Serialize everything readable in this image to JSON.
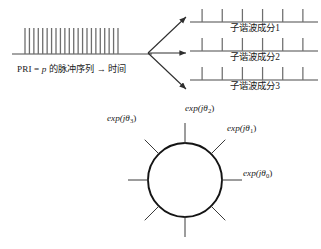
{
  "figure": {
    "background": "#ffffff",
    "line_color": "#3a3a3a",
    "pulse_color": "#6e6e6e",
    "circle_color": "#141414"
  },
  "pulse_train": {
    "caption_prefix": "PRI = ",
    "caption_var": "p",
    "caption_suffix": " 的脉冲序列 → 时间",
    "caption_full": "PRI = p 的脉冲序列 → 时间",
    "pulse_count": 22,
    "baseline_y": 54,
    "x_start": 25,
    "x_end": 118,
    "pulse_height": 26
  },
  "arrows": {
    "origin_x": 148,
    "origin_y": 53,
    "count": 3,
    "targets": [
      {
        "x": 186,
        "y": 17
      },
      {
        "x": 186,
        "y": 53
      },
      {
        "x": 186,
        "y": 89
      }
    ]
  },
  "subharmonic_panels": [
    {
      "label": "子谐波成分1",
      "baseline_y": 22,
      "x_start": 190,
      "x_end": 318,
      "tick_count": 6,
      "tick_height": 13
    },
    {
      "label": "子谐波成分2",
      "baseline_y": 51,
      "x_start": 190,
      "x_end": 318,
      "tick_count": 6,
      "tick_height": 13
    },
    {
      "label": "子谐波成分3",
      "baseline_y": 80,
      "x_start": 190,
      "x_end": 318,
      "tick_count": 6,
      "tick_height": 13
    }
  ],
  "phasor_circle": {
    "center_x": 185,
    "center_y": 180,
    "radius": 37,
    "spoke_count": 8,
    "spoke_length": 20,
    "spoke_angles_deg": [
      0,
      45,
      90,
      135,
      180,
      225,
      270,
      315
    ],
    "labels": [
      {
        "id": "theta0",
        "text": "exp(jθ",
        "sub": "0",
        "tail": ")",
        "full": "exp(jθ0)"
      },
      {
        "id": "theta1",
        "text": "exp(jθ",
        "sub": "1",
        "tail": ")",
        "full": "exp(jθ1)"
      },
      {
        "id": "theta2",
        "text": "exp(jθ",
        "sub": "2",
        "tail": ")",
        "full": "exp(jθ2)"
      },
      {
        "id": "theta3",
        "text": "exp(jθ",
        "sub": "3",
        "tail": ")",
        "full": "exp(jθ3)"
      }
    ]
  }
}
